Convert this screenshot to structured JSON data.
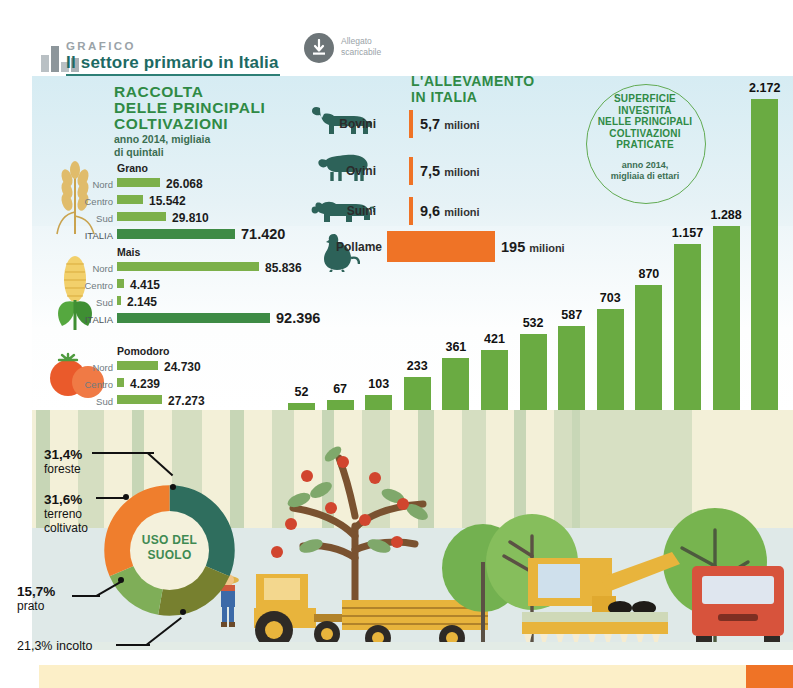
{
  "header": {
    "kicker": "GRAFICO",
    "title": "Il settore primario in Italia",
    "download_line1": "Allegato",
    "download_line2": "scaricabile",
    "download_icon": "download-arrow-icon"
  },
  "crops": {
    "title_line1": "RACCOLTA",
    "title_line2": "DELLE PRINCIPALI",
    "title_line3": "COLTIVAZIONI",
    "subtitle_line1": "anno 2014, migliaia",
    "subtitle_line2": "di quintali",
    "groups": [
      {
        "name": "Grano",
        "icon": "wheat-icon",
        "rows": [
          {
            "label": "Nord",
            "value": "26.068",
            "num": 26068
          },
          {
            "label": "Centro",
            "value": "15.542",
            "num": 15542
          },
          {
            "label": "Sud",
            "value": "29.810",
            "num": 29810
          },
          {
            "label": "ITALIA",
            "value": "71.420",
            "num": 71420
          }
        ]
      },
      {
        "name": "Mais",
        "icon": "corn-icon",
        "rows": [
          {
            "label": "Nord",
            "value": "85.836",
            "num": 85836
          },
          {
            "label": "Centro",
            "value": "4.415",
            "num": 4415
          },
          {
            "label": "Sud",
            "value": "2.145",
            "num": 2145
          },
          {
            "label": "ITALIA",
            "value": "92.396",
            "num": 92396
          }
        ]
      },
      {
        "name": "Pomodoro",
        "icon": "tomato-icon",
        "rows": [
          {
            "label": "Nord",
            "value": "24.730",
            "num": 24730
          },
          {
            "label": "Centro",
            "value": "4.239",
            "num": 4239
          },
          {
            "label": "Sud",
            "value": "27.273",
            "num": 27273
          },
          {
            "label": "ITALIA",
            "value": "56.242",
            "num": 56242
          }
        ]
      }
    ]
  },
  "livestock": {
    "title_line1": "L'ALLEVAMENTO",
    "title_line2": "IN ITALIA",
    "unit": "milioni",
    "rows": [
      {
        "name": "Bovini",
        "icon": "cow-icon",
        "value": "5,7",
        "num": 5.7
      },
      {
        "name": "Ovini",
        "icon": "sheep-icon",
        "value": "7,5",
        "num": 7.5
      },
      {
        "name": "Suini",
        "icon": "pig-icon",
        "value": "9,6",
        "num": 9.6
      },
      {
        "name": "Pollame",
        "icon": "poultry-icon",
        "value": "195",
        "num": 195
      }
    ]
  },
  "surface_circle": {
    "line1": "SUPERFICIE",
    "line2": "INVESTITA",
    "line3": "NELLE PRINCIPALI",
    "line4": "COLTIVAZIONI",
    "line5": "PRATICATE",
    "sub1": "anno 2014,",
    "sub2": "migliaia di ettari"
  },
  "chart_data": {
    "type": "bar",
    "title": "Superficie investita nelle principali coltivazioni praticate",
    "subtitle": "anno 2014, migliaia di ettari",
    "xlabel": "",
    "ylabel": "migliaia di ettari",
    "ylim": [
      0,
      2172
    ],
    "grid": false,
    "legend": "none",
    "categories": [
      "Patate",
      "Legumi",
      "Avena",
      "Orzo",
      "Semi oleosi",
      "Ortaggi",
      "Agrumi e altra frutta",
      "Grano tenero",
      "Vite",
      "Mais",
      "Olivo",
      "Grano duro",
      "Foraggere"
    ],
    "labels": [
      [
        "Patate"
      ],
      [
        "Legumi"
      ],
      [
        "Avena"
      ],
      [
        "Orzo"
      ],
      [
        "Semi",
        "oleosi"
      ],
      [
        "Ortaggi"
      ],
      [
        "Agrumi",
        "e altra",
        "frutta"
      ],
      [
        "Grano",
        "tenero"
      ],
      [
        "Vite"
      ],
      [
        "Mais"
      ],
      [
        "Olivo"
      ],
      [
        "Grano",
        "duro"
      ],
      [
        "Foraggere"
      ]
    ],
    "values": [
      52,
      67,
      103,
      233,
      361,
      421,
      532,
      587,
      703,
      870,
      1157,
      1288,
      2172
    ],
    "value_labels": [
      "52",
      "67",
      "103",
      "233",
      "361",
      "421",
      "532",
      "587",
      "703",
      "870",
      "1.157",
      "1.288",
      "2.172"
    ],
    "icons": [
      "potato-icon",
      "legumes-icon",
      "oat-icon",
      "barley-icon",
      "oilseed-icon",
      "vegetables-icon",
      "citrus-icon",
      "soft-wheat-icon",
      "grape-icon",
      "corn-icon",
      "olive-icon",
      "durum-wheat-icon",
      "forage-icon"
    ]
  },
  "land_use": {
    "center_line1": "USO DEL",
    "center_line2": "SUOLO",
    "type": "pie",
    "slices": [
      {
        "label": "foreste",
        "value": "31,4%",
        "num": 31.4,
        "color": "#2f6e5e"
      },
      {
        "label": "incolto",
        "value": "21,3%",
        "num": 21.3,
        "color": "#77802f"
      },
      {
        "label": "prato",
        "value": "15,7%",
        "num": 15.7,
        "color": "#7fae58"
      },
      {
        "label": "terreno coltivato",
        "value": "31,6%",
        "num": 31.6,
        "color": "#ef7e2d"
      }
    ]
  },
  "colors": {
    "green": "#2f8a45",
    "bar_green": "#6aab42",
    "dark_green": "#3e8b45",
    "orange": "#ef7326",
    "teal": "#1d6a63",
    "panel_blue": "#d6ecf3"
  }
}
